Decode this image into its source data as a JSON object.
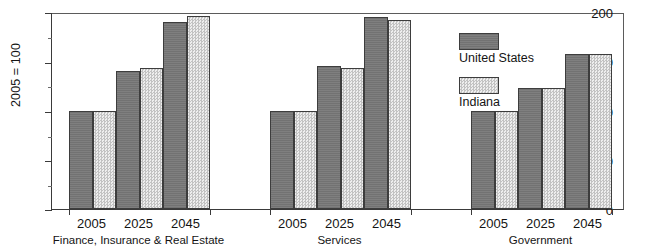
{
  "chart_data": {
    "type": "bar",
    "title": "",
    "xlabel": "",
    "ylabel": "2005 = 100",
    "ylim": [
      0,
      200
    ],
    "ytick_labels": [
      "200",
      "150",
      "100",
      "50",
      "0"
    ],
    "ytick_values": [
      200,
      150,
      100,
      50,
      0
    ],
    "yminor_values": [
      175,
      125,
      75,
      25
    ],
    "grid": false,
    "legend_position": "upper-right-inside",
    "categories": [
      "2005",
      "2025",
      "2045"
    ],
    "groups": [
      {
        "name": "Finance, Insurance & Real Estate",
        "categories": [
          "2005",
          "2025",
          "2045"
        ],
        "series": [
          {
            "name": "United States",
            "values": [
              100,
              140,
              190
            ]
          },
          {
            "name": "Indiana",
            "values": [
              100,
              143,
              196
            ]
          }
        ]
      },
      {
        "name": "Services",
        "categories": [
          "2005",
          "2025",
          "2045"
        ],
        "series": [
          {
            "name": "United States",
            "values": [
              100,
              145,
              195
            ]
          },
          {
            "name": "Indiana",
            "values": [
              100,
              143,
              192
            ]
          }
        ]
      },
      {
        "name": "Government",
        "categories": [
          "2005",
          "2025",
          "2045"
        ],
        "series": [
          {
            "name": "United States",
            "values": [
              100,
              123,
              157
            ]
          },
          {
            "name": "Indiana",
            "values": [
              100,
              123,
              157
            ]
          }
        ]
      }
    ],
    "series_colors": {
      "United States": "#787878",
      "Indiana": "#d9d9d9"
    }
  },
  "legend": {
    "items": [
      {
        "label": "United States",
        "swatch": "us-swatch"
      },
      {
        "label": "Indiana",
        "swatch": "indiana-swatch"
      }
    ]
  },
  "axis": {
    "y_label": "2005 = 100",
    "y_ticks": [
      "200",
      "150",
      "100",
      "50",
      "0"
    ]
  },
  "group_labels": [
    "Finance, Insurance & Real Estate",
    "Services",
    "Government"
  ],
  "year_labels": [
    "2005",
    "2025",
    "2045"
  ]
}
